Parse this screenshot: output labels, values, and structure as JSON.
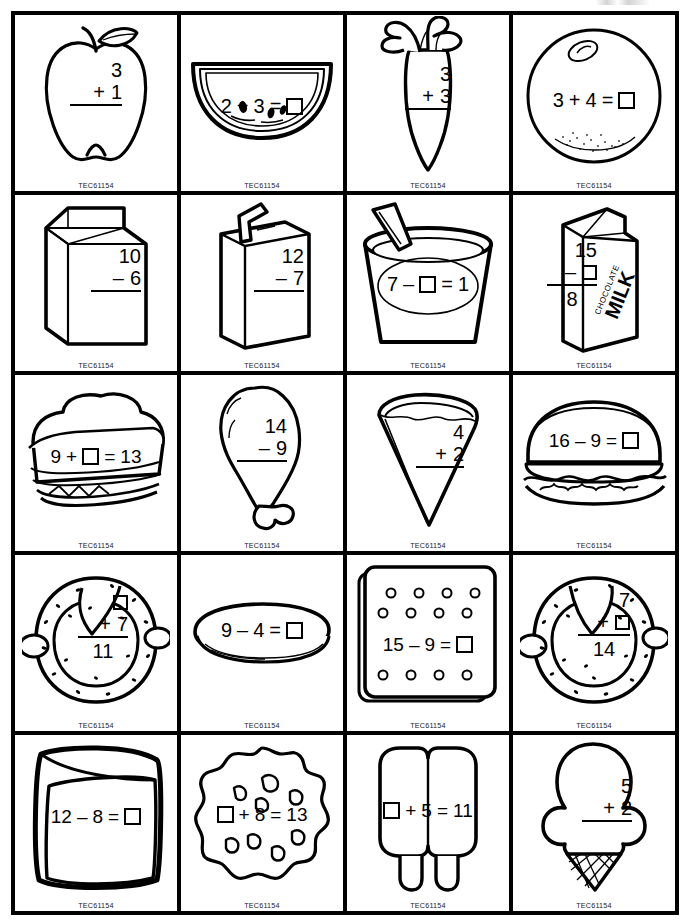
{
  "page": {
    "publisher_code": "TEC61154",
    "grid": {
      "columns": 4,
      "rows": 5,
      "total_cards": 20
    },
    "ink_color": "#000000",
    "background_color": "#ffffff"
  },
  "cards": [
    {
      "id": 1,
      "icon": "apple-icon",
      "subject": "apple",
      "layout": "vertical",
      "top": "3",
      "operator": "+",
      "bottom": "1",
      "result": "",
      "equation_text": "3 + 1",
      "blank_position": "answer"
    },
    {
      "id": 2,
      "icon": "watermelon-icon",
      "subject": "watermelon slice",
      "layout": "horizontal",
      "left": "2",
      "operator": "+",
      "right": "3",
      "result": "box",
      "equation_text": "2 + 3 = □",
      "blank_position": "answer"
    },
    {
      "id": 3,
      "icon": "carrot-icon",
      "subject": "carrot",
      "layout": "vertical",
      "top": "3",
      "operator": "+",
      "bottom": "3",
      "result": "",
      "equation_text": "3 + 3",
      "blank_position": "answer"
    },
    {
      "id": 4,
      "icon": "orange-icon",
      "subject": "orange",
      "layout": "horizontal",
      "left": "3",
      "operator": "+",
      "right": "4",
      "result": "box",
      "equation_text": "3 + 4 = □",
      "blank_position": "answer"
    },
    {
      "id": 5,
      "icon": "milk-carton-icon",
      "subject": "milk carton",
      "layout": "vertical",
      "top": "10",
      "operator": "–",
      "bottom": "6",
      "result": "",
      "equation_text": "10 – 6",
      "blank_position": "answer"
    },
    {
      "id": 6,
      "icon": "juice-box-icon",
      "subject": "juice box with straw",
      "layout": "vertical",
      "top": "12",
      "operator": "–",
      "bottom": "7",
      "result": "",
      "equation_text": "12 – 7",
      "blank_position": "answer"
    },
    {
      "id": 7,
      "icon": "yogurt-cup-icon",
      "subject": "yogurt cup with spoon",
      "layout": "horizontal",
      "left": "7",
      "operator": "–",
      "right": "box",
      "result": "1",
      "equation_text": "7 – □ = 1",
      "blank_position": "middle"
    },
    {
      "id": 8,
      "icon": "chocolate-milk-icon",
      "subject": "chocolate milk carton",
      "layout": "vertical",
      "top": "15",
      "operator": "–",
      "bottom": "box",
      "result": "8",
      "equation_text": "15 – □ = 8",
      "blank_position": "subtrahend",
      "label": "CHOCOLATE MILK"
    },
    {
      "id": 9,
      "icon": "sandwich-icon",
      "subject": "sandwich",
      "layout": "horizontal",
      "left": "9",
      "operator": "+",
      "right": "box",
      "result": "13",
      "equation_text": "9 + □ = 13",
      "blank_position": "middle"
    },
    {
      "id": 10,
      "icon": "drumstick-icon",
      "subject": "chicken drumstick",
      "layout": "vertical",
      "top": "14",
      "operator": "–",
      "bottom": "9",
      "result": "",
      "equation_text": "14 – 9",
      "blank_position": "answer"
    },
    {
      "id": 11,
      "icon": "pizza-slice-icon",
      "subject": "pizza slice",
      "layout": "vertical",
      "top": "4",
      "operator": "+",
      "bottom": "2",
      "result": "",
      "equation_text": "4 + 2",
      "blank_position": "answer"
    },
    {
      "id": 12,
      "icon": "hamburger-icon",
      "subject": "hamburger",
      "layout": "horizontal",
      "left": "16",
      "operator": "–",
      "right": "9",
      "result": "box",
      "equation_text": "16 – 9 = □",
      "blank_position": "answer"
    },
    {
      "id": 13,
      "icon": "pretzel-icon",
      "subject": "pretzel",
      "layout": "vertical",
      "top": "box",
      "operator": "+",
      "bottom": "7",
      "result": "11",
      "equation_text": "□ + 7 = 11",
      "blank_position": "addend"
    },
    {
      "id": 14,
      "icon": "pancake-icon",
      "subject": "pancake",
      "layout": "horizontal",
      "left": "9",
      "operator": "–",
      "right": "4",
      "result": "box",
      "equation_text": "9 – 4 = □",
      "blank_position": "answer"
    },
    {
      "id": 15,
      "icon": "cracker-icon",
      "subject": "cracker",
      "layout": "horizontal",
      "left": "15",
      "operator": "–",
      "right": "9",
      "result": "box",
      "equation_text": "15 – 9 = □",
      "blank_position": "answer"
    },
    {
      "id": 16,
      "icon": "pretzel-icon",
      "subject": "pretzel",
      "layout": "vertical",
      "top": "7",
      "operator": "+",
      "bottom": "box",
      "result": "14",
      "equation_text": "7 + □ = 14",
      "blank_position": "addend"
    },
    {
      "id": 17,
      "icon": "cheese-slice-icon",
      "subject": "cheese slice",
      "layout": "horizontal",
      "left": "12",
      "operator": "–",
      "right": "8",
      "result": "box",
      "equation_text": "12 – 8 = □",
      "blank_position": "answer"
    },
    {
      "id": 18,
      "icon": "cookie-icon",
      "subject": "chocolate chip cookie",
      "layout": "horizontal",
      "left": "box",
      "operator": "+",
      "right": "8",
      "result": "13",
      "equation_text": "□ + 8 = 13",
      "blank_position": "first"
    },
    {
      "id": 19,
      "icon": "popsicle-icon",
      "subject": "twin popsicle",
      "layout": "horizontal",
      "left": "box",
      "operator": "+",
      "right": "5",
      "result": "11",
      "equation_text": "□ + 5 = 11",
      "blank_position": "first"
    },
    {
      "id": 20,
      "icon": "ice-cream-cone-icon",
      "subject": "ice cream cone",
      "layout": "vertical",
      "top": "5",
      "operator": "+",
      "bottom": "2",
      "result": "",
      "equation_text": "5 + 2",
      "blank_position": "answer"
    }
  ]
}
